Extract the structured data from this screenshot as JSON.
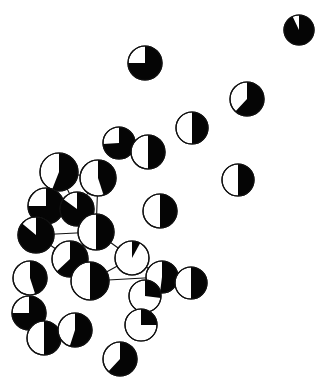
{
  "figure": {
    "kind": "pie-glyph-spatial-network",
    "title": "",
    "caption": "",
    "width": 326,
    "height": 389,
    "background_color": "#ffffff",
    "fill_color": "#050505",
    "empty_color": "#ffffff",
    "outline_color": "#111111",
    "outline_width": 1.2,
    "edge_color": "#111111",
    "edge_width": 1.1,
    "wedge_start_angle_deg": -90,
    "wedge_direction": "clockwise",
    "legend": [],
    "axis_labels": [],
    "annotations": []
  },
  "chart_data": {
    "type": "scatter",
    "title": "",
    "subtitle": "",
    "xlabel": "",
    "ylabel": "",
    "xlim": [
      0,
      326
    ],
    "ylim": [
      0,
      389
    ],
    "grid": false,
    "legend_position": "none",
    "marker": "pie",
    "value_label": "black fraction",
    "series": [
      {
        "name": "black fraction",
        "color": "#050505",
        "values": [
          0.93,
          0.75,
          0.62,
          0.5,
          0.74,
          0.5,
          0.5,
          0.56,
          0.45,
          0.75,
          0.85,
          0.5,
          0.86,
          0.5,
          0.63,
          0.5,
          0.5,
          0.08,
          0.45,
          0.5,
          0.52,
          0.5,
          0.5,
          0.55,
          0.5,
          0.27,
          0.75,
          0.5,
          0.5,
          0.25,
          0.5
        ]
      }
    ],
    "points": [
      {
        "id": "n01",
        "x": 299,
        "y": 30,
        "r": 15,
        "black_fraction": 0.93,
        "white_fraction": 0.07,
        "connected": false
      },
      {
        "id": "n02",
        "x": 145,
        "y": 63,
        "r": 17,
        "black_fraction": 0.75,
        "white_fraction": 0.25,
        "connected": false
      },
      {
        "id": "n03",
        "x": 247,
        "y": 99,
        "r": 17,
        "black_fraction": 0.62,
        "white_fraction": 0.38,
        "connected": false
      },
      {
        "id": "n04",
        "x": 192,
        "y": 128,
        "r": 16,
        "black_fraction": 0.5,
        "white_fraction": 0.5,
        "connected": false
      },
      {
        "id": "n05",
        "x": 119,
        "y": 143,
        "r": 16,
        "black_fraction": 0.74,
        "white_fraction": 0.26,
        "connected": false
      },
      {
        "id": "n06",
        "x": 148,
        "y": 152,
        "r": 17,
        "black_fraction": 0.5,
        "white_fraction": 0.5,
        "connected": false
      },
      {
        "id": "n07",
        "x": 238,
        "y": 180,
        "r": 16,
        "black_fraction": 0.5,
        "white_fraction": 0.5,
        "connected": false
      },
      {
        "id": "n08",
        "x": 59,
        "y": 172,
        "r": 19,
        "black_fraction": 0.56,
        "white_fraction": 0.44,
        "connected": true
      },
      {
        "id": "n09",
        "x": 98,
        "y": 178,
        "r": 18,
        "black_fraction": 0.45,
        "white_fraction": 0.55,
        "connected": true
      },
      {
        "id": "n10",
        "x": 46,
        "y": 206,
        "r": 18,
        "black_fraction": 0.75,
        "white_fraction": 0.25,
        "connected": true
      },
      {
        "id": "n11",
        "x": 77,
        "y": 209,
        "r": 17,
        "black_fraction": 0.85,
        "white_fraction": 0.15,
        "connected": true
      },
      {
        "id": "n12",
        "x": 160,
        "y": 211,
        "r": 17,
        "black_fraction": 0.5,
        "white_fraction": 0.5,
        "connected": false
      },
      {
        "id": "n13",
        "x": 36,
        "y": 235,
        "r": 18,
        "black_fraction": 0.86,
        "white_fraction": 0.14,
        "connected": true
      },
      {
        "id": "n14",
        "x": 96,
        "y": 232,
        "r": 18,
        "black_fraction": 0.5,
        "white_fraction": 0.5,
        "connected": true
      },
      {
        "id": "n15",
        "x": 70,
        "y": 259,
        "r": 18,
        "black_fraction": 0.63,
        "white_fraction": 0.37,
        "connected": true
      },
      {
        "id": "n16",
        "x": 132,
        "y": 258,
        "r": 17,
        "black_fraction": 0.08,
        "white_fraction": 0.92,
        "connected": true
      },
      {
        "id": "n17",
        "x": 30,
        "y": 278,
        "r": 17,
        "black_fraction": 0.45,
        "white_fraction": 0.55,
        "connected": false
      },
      {
        "id": "n18",
        "x": 90,
        "y": 281,
        "r": 19,
        "black_fraction": 0.5,
        "white_fraction": 0.5,
        "connected": true
      },
      {
        "id": "n19",
        "x": 162,
        "y": 277,
        "r": 16,
        "black_fraction": 0.52,
        "white_fraction": 0.48,
        "connected": true
      },
      {
        "id": "n20",
        "x": 191,
        "y": 283,
        "r": 16,
        "black_fraction": 0.5,
        "white_fraction": 0.5,
        "connected": false
      },
      {
        "id": "n21",
        "x": 145,
        "y": 296,
        "r": 16,
        "black_fraction": 0.27,
        "white_fraction": 0.73,
        "connected": true
      },
      {
        "id": "n22",
        "x": 29,
        "y": 313,
        "r": 17,
        "black_fraction": 0.75,
        "white_fraction": 0.25,
        "connected": false
      },
      {
        "id": "n23",
        "x": 44,
        "y": 338,
        "r": 17,
        "black_fraction": 0.5,
        "white_fraction": 0.5,
        "connected": false
      },
      {
        "id": "n24",
        "x": 75,
        "y": 330,
        "r": 17,
        "black_fraction": 0.55,
        "white_fraction": 0.45,
        "connected": false
      },
      {
        "id": "n25",
        "x": 141,
        "y": 325,
        "r": 16,
        "black_fraction": 0.25,
        "white_fraction": 0.75,
        "connected": false
      },
      {
        "id": "n26",
        "x": 120,
        "y": 359,
        "r": 17,
        "black_fraction": 0.62,
        "white_fraction": 0.38,
        "connected": false
      }
    ],
    "edges": [
      {
        "from": "n08",
        "to": "n09"
      },
      {
        "from": "n08",
        "to": "n11"
      },
      {
        "from": "n08",
        "to": "n10"
      },
      {
        "from": "n09",
        "to": "n11"
      },
      {
        "from": "n09",
        "to": "n14"
      },
      {
        "from": "n10",
        "to": "n11"
      },
      {
        "from": "n10",
        "to": "n13"
      },
      {
        "from": "n11",
        "to": "n14"
      },
      {
        "from": "n13",
        "to": "n15"
      },
      {
        "from": "n14",
        "to": "n16"
      },
      {
        "from": "n14",
        "to": "n15"
      },
      {
        "from": "n15",
        "to": "n18"
      },
      {
        "from": "n16",
        "to": "n18"
      },
      {
        "from": "n16",
        "to": "n19"
      },
      {
        "from": "n18",
        "to": "n19"
      },
      {
        "from": "n19",
        "to": "n21"
      },
      {
        "from": "n13",
        "to": "n14"
      }
    ]
  }
}
